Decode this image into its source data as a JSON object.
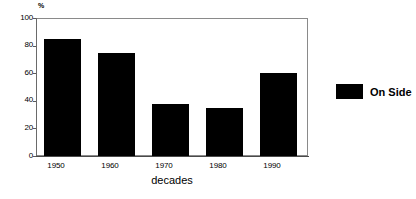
{
  "chart_data": {
    "type": "bar",
    "title": "",
    "subtitle": "",
    "categories": [
      "1950",
      "1960",
      "1970",
      "1980",
      "1990"
    ],
    "values": [
      85,
      75,
      38,
      35,
      60
    ],
    "series": [
      {
        "name": "On Side",
        "values": [
          85,
          75,
          38,
          35,
          60
        ],
        "color": "#000000"
      }
    ],
    "xlabel": "decades",
    "ylabel": "",
    "yunit": "%",
    "ylim": [
      0,
      100
    ],
    "yticks": [
      0,
      20,
      40,
      60,
      80,
      100
    ],
    "ytick_labels": [
      "0",
      "20",
      "40",
      "60",
      "80",
      "100"
    ],
    "grid": false,
    "legend": {
      "position": "right",
      "entries": [
        {
          "label": "On Side",
          "color": "#000000"
        }
      ]
    },
    "frame_color": "#8a8a8a",
    "background": "#ffffff"
  }
}
